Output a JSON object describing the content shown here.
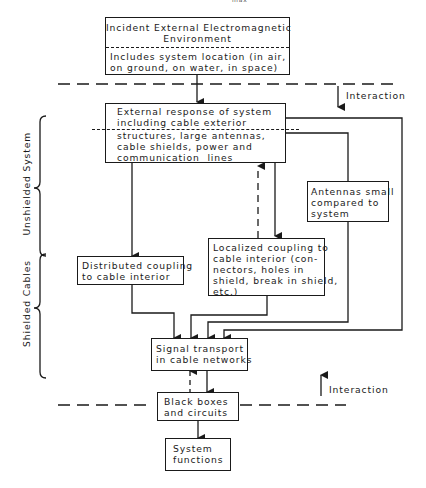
{
  "header_fragment": "max",
  "boxes": {
    "incident": {
      "title": "Incident External Electromagnetic\nEnvironment",
      "detail": "Includes system location (in air,\non ground, on water, in space)"
    },
    "external_response": {
      "line1": "External response of system\nincluding cable exterior",
      "line2": "structures, large antennas,\ncable shields, power and\ncommunication  lines"
    },
    "distributed": {
      "text": "Distributed coupling\nto cable interior"
    },
    "localized": {
      "text": "Localized coupling to\ncable interior (con-\nnectors, holes in\nshield, break in shield,\netc.)"
    },
    "antennas": {
      "text": "Antennas small\ncompared to\nsystem"
    },
    "signal": {
      "text": "Signal transport\nin cable networks"
    },
    "blackbox": {
      "text": "Black boxes\nand circuits"
    },
    "functions": {
      "text": "System\nfunctions"
    }
  },
  "annotations": {
    "interaction_top": "Interaction",
    "interaction_bottom": "Interaction",
    "unshielded": "Unshielded System",
    "shielded": "Shielded Cables"
  },
  "colors": {
    "line": "#1a1a1a",
    "background": "#ffffff"
  }
}
